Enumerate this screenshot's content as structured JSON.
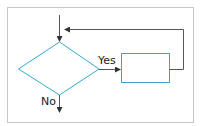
{
  "diagram": {
    "type": "flowchart",
    "colors": {
      "frame": "#c8c8c8",
      "shape_stroke": "#3aa8c8",
      "connector": "#555555",
      "text": "#222222"
    },
    "nodes": [
      {
        "id": "decision",
        "shape": "diamond",
        "label": ""
      },
      {
        "id": "process",
        "shape": "rectangle",
        "label": ""
      }
    ],
    "edges": [
      {
        "from": "entry",
        "to": "decision",
        "label": ""
      },
      {
        "from": "decision",
        "to": "process",
        "label": "Yes"
      },
      {
        "from": "process",
        "to": "decision-entry",
        "label": ""
      },
      {
        "from": "decision",
        "to": "exit",
        "label": "No"
      }
    ],
    "labels": {
      "yes": "Yes",
      "no": "No"
    }
  }
}
